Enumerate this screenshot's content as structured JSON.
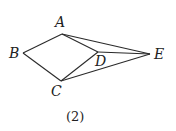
{
  "diagram": {
    "caption": "(2)",
    "stroke_color": "#2a2a2a",
    "vertices": {
      "A": {
        "label": "A",
        "x": 62,
        "y": 34,
        "lx": 55,
        "ly": 27
      },
      "B": {
        "label": "B",
        "x": 23,
        "y": 53,
        "lx": 9,
        "ly": 58
      },
      "C": {
        "label": "C",
        "x": 61,
        "y": 81,
        "lx": 51,
        "ly": 96
      },
      "D": {
        "label": "D",
        "x": 98,
        "y": 52,
        "lx": 95,
        "ly": 66
      },
      "E": {
        "label": "E",
        "x": 150,
        "y": 54,
        "lx": 154,
        "ly": 59
      }
    },
    "edges": [
      [
        "A",
        "B"
      ],
      [
        "B",
        "C"
      ],
      [
        "A",
        "D"
      ],
      [
        "A",
        "E"
      ],
      [
        "C",
        "D"
      ],
      [
        "C",
        "E"
      ],
      [
        "D",
        "E"
      ]
    ]
  }
}
